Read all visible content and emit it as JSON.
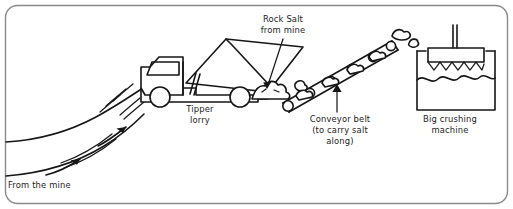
{
  "diagram": {
    "frame": {
      "border_color": "#8a8a8a",
      "background_color": "#ffffff"
    },
    "ink_color": "#161616",
    "labels": [
      {
        "id": "rock-salt",
        "lines": [
          "Rock Salt",
          "from mine"
        ],
        "line1": "Rock Salt",
        "line2": "from mine",
        "x": 283,
        "y": 22,
        "leader": "points down-left to salt pile at conveyor base"
      },
      {
        "id": "tipper-lorry",
        "lines": [
          "Tipper",
          "lorry"
        ],
        "line1": "Tipper",
        "line2": "lorry",
        "x": 200,
        "y": 112
      },
      {
        "id": "conveyor-belt",
        "lines": [
          "Conveyor belt",
          "(to carry salt",
          "along)"
        ],
        "line1": "Conveyor belt",
        "line2": "(to carry salt",
        "line3": "along)",
        "x": 340,
        "y": 122,
        "leader": "arrow points up to the conveyor belt"
      },
      {
        "id": "big-crushing-machine",
        "lines": [
          "Big crushing",
          "machine"
        ],
        "line1": "Big crushing",
        "line2": "machine",
        "x": 450,
        "y": 122
      },
      {
        "id": "from-the-mine",
        "lines": [
          "From the mine"
        ],
        "line1": "From the mine",
        "x": 8,
        "y": 188
      }
    ],
    "elements": [
      {
        "id": "road",
        "name": "road-from-mine",
        "description": "curved road rising from bottom-left to the lorry, with dashed centre markings and two direction arrows"
      },
      {
        "id": "lorry",
        "name": "tipper-lorry",
        "description": "tipper lorry with cab, two wheels, raised tipping body and hydraulic ram, dumping rock salt"
      },
      {
        "id": "salt-pile",
        "name": "rock-salt-pile",
        "description": "heap of rock salt lumps at the foot of the conveyor"
      },
      {
        "id": "conveyor",
        "name": "conveyor-belt",
        "description": "inclined conveyor belt with six rollers carrying lumps of rock salt upward to the right"
      },
      {
        "id": "crusher",
        "name": "big-crushing-machine",
        "description": "open-topped box with vertical shaft and a toothed crushing plate above wavy crushed salt"
      }
    ]
  }
}
